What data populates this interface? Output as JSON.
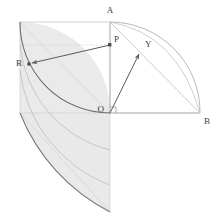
{
  "figure": {
    "width": 217,
    "height": 222,
    "background": "#ffffff"
  },
  "colors": {
    "background": "#ffffff",
    "shade_fill": "#e8e8e8",
    "shade_fill_light": "#f1f1f1",
    "thin_line": "#b9b9b9",
    "faint_line": "#d2d2d2",
    "dark_line": "#6f6f6f",
    "arc_dark": "#5f5f5f",
    "label_text": "#3c3c3c"
  },
  "points": [
    {
      "id": "A",
      "label": "A",
      "x": 110,
      "y": 22,
      "label_x": 110,
      "label_y": 13,
      "anchor": "middle"
    },
    {
      "id": "B",
      "label": "B",
      "x": 200,
      "y": 113,
      "label_x": 204,
      "label_y": 124,
      "anchor": "start"
    },
    {
      "id": "O",
      "label": "O",
      "x": 110,
      "y": 113,
      "label_x": 104,
      "label_y": 112,
      "anchor": "end"
    },
    {
      "id": "P",
      "label": "P",
      "x": 110,
      "y": 45,
      "label_x": 114,
      "label_y": 42,
      "anchor": "start"
    },
    {
      "id": "R",
      "label": "R",
      "x": 29,
      "y": 64,
      "label_x": 24,
      "label_y": 64,
      "anchor": "end"
    },
    {
      "id": "Y",
      "label": "Y",
      "x": 141,
      "y": 51,
      "label_x": 145,
      "label_y": 46,
      "anchor": "start"
    }
  ],
  "geometry": {
    "origin": {
      "x": 110,
      "y": 113
    },
    "radius": 90,
    "square": {
      "x": 20,
      "y": 22,
      "width": 90,
      "height": 91
    },
    "quarter_arc_right": {
      "from": "A",
      "to": "B",
      "center": "O"
    },
    "shaded_quadrant_center": {
      "x": 20,
      "y": 22
    },
    "shaded_quadrant_radius": 90,
    "right_angle_marker_at": "O"
  },
  "segments": [
    {
      "name": "axis-vertical-OA",
      "from": "O",
      "to": "A"
    },
    {
      "name": "axis-horizontal-OB",
      "from": "O",
      "to": "B"
    },
    {
      "name": "chord-AB",
      "from": "A",
      "to": "B"
    },
    {
      "name": "ray-OY-extended-to-arc",
      "from": "O",
      "to": "B"
    },
    {
      "name": "arrow-P-to-R",
      "from": "P",
      "to": "R"
    },
    {
      "name": "arrow-O-to-Y",
      "from": "O",
      "to": "Y"
    }
  ],
  "annotations": {
    "arrow_PR": "P to R",
    "arrow_OY": "O to Y",
    "right_angle": "right angle at O"
  }
}
